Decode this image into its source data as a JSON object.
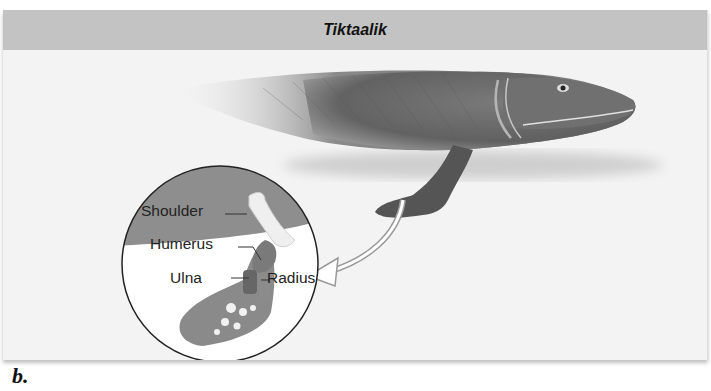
{
  "figure": {
    "title": "Tiktaalik",
    "panel_label": "b.",
    "inset": {
      "labels": [
        {
          "text": "Shoulder",
          "target": "shoulder bone"
        },
        {
          "text": "Humerus",
          "target": "humerus bone"
        },
        {
          "text": "Ulna",
          "target": "ulna bone"
        },
        {
          "text": "Radius",
          "target": "radius bone"
        }
      ]
    },
    "colors": {
      "header_bg": "#c3c3c3",
      "panel_bg": "#f3f3f3",
      "inset_top": "#8e8e8e",
      "body_tone": "#6d6d6d"
    }
  }
}
